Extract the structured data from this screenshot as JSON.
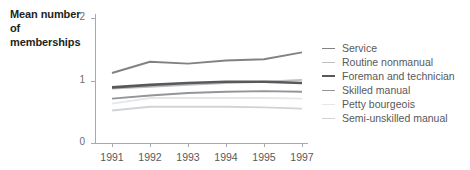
{
  "axis_title": "Mean number of memberships",
  "chart_data": {
    "type": "line",
    "title": "",
    "subtitle": "",
    "xlabel": "",
    "ylabel": "Mean number of memberships",
    "categories": [
      "1991",
      "1992",
      "1993",
      "1994",
      "1995",
      "1997"
    ],
    "x_tick_labels": [
      "1991",
      "1992",
      "1993",
      "1994",
      "1995",
      "1997"
    ],
    "y_tick_labels": [
      "0",
      "1",
      "2"
    ],
    "y_ticks": [
      0,
      1,
      2
    ],
    "ylim": [
      0,
      2
    ],
    "grid": false,
    "legend_position": "right",
    "series": [
      {
        "name": "Service",
        "color": "#808285",
        "width": 1.9,
        "values": [
          1.12,
          1.3,
          1.27,
          1.32,
          1.34,
          1.45
        ]
      },
      {
        "name": "Routine nonmanual",
        "color": "#bcbec0",
        "width": 1.9,
        "values": [
          0.87,
          0.9,
          0.93,
          0.96,
          0.98,
          1.01
        ]
      },
      {
        "name": "Foreman and technician",
        "color": "#58595b",
        "width": 2.6,
        "values": [
          0.89,
          0.93,
          0.96,
          0.98,
          0.98,
          0.96
        ]
      },
      {
        "name": "Skilled manual",
        "color": "#939598",
        "width": 1.9,
        "values": [
          0.71,
          0.76,
          0.8,
          0.82,
          0.83,
          0.82
        ]
      },
      {
        "name": "Petty bourgeois",
        "color": "#e6e7e8",
        "width": 1.9,
        "values": [
          0.63,
          0.72,
          0.72,
          0.72,
          0.72,
          0.71
        ]
      },
      {
        "name": "Semi-unskilled manual",
        "color": "#d1d3d4",
        "width": 1.9,
        "values": [
          0.52,
          0.58,
          0.58,
          0.58,
          0.57,
          0.55
        ]
      }
    ]
  }
}
